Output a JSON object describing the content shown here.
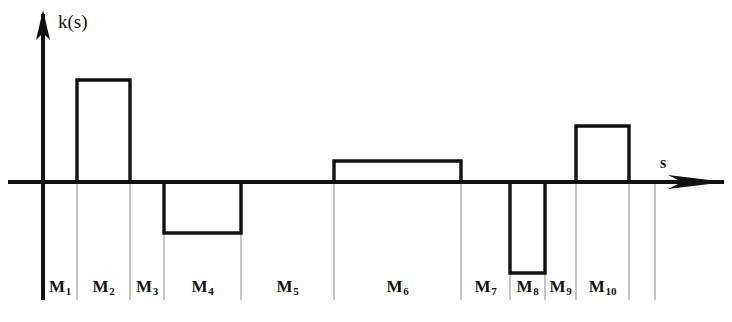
{
  "figure": {
    "kind": "piecewise-constant-curvature-plot",
    "background_color": "#ffffff",
    "stroke_color": "#111111",
    "divider_color": "#8a8a8a",
    "width": 732,
    "height": 322
  },
  "axes": {
    "y_axis_label": "k(s)",
    "x_axis_label": "s",
    "y_axis_x": 43,
    "baseline_y": 182,
    "y_axis_top": 10,
    "y_axis_bottom": 300,
    "x_axis_start": 8,
    "x_axis_end": 726,
    "y_label_pos": {
      "x": 58,
      "y": 12
    },
    "x_label_pos": {
      "x": 660,
      "y": 155
    }
  },
  "chart_data": {
    "type": "bar",
    "title": "",
    "xlabel": "s",
    "ylabel": "k(s)",
    "grid": false,
    "legend": null,
    "baseline": 0,
    "categories": [
      "M1",
      "M2",
      "M3",
      "M4",
      "M5",
      "M6",
      "M7",
      "M8",
      "M9",
      "M10"
    ],
    "tick_labels": [
      "M₁",
      "M₂",
      "M₃",
      "M₄",
      "M₅",
      "M₆",
      "M₇",
      "M₈",
      "M₉",
      "M₁₀"
    ],
    "values": [
      0,
      1.0,
      0,
      -0.5,
      0,
      0.21,
      0,
      -0.89,
      0,
      0.55
    ],
    "value_note": "heights in pixels above/below baseline, scaled by 102 px per 1.0 unit",
    "segments": [
      {
        "label": "M1",
        "sub": "1",
        "x0": 43,
        "x1": 77,
        "height_px": 0,
        "value": 0,
        "sign": "zero"
      },
      {
        "label": "M2",
        "sub": "2",
        "x0": 77,
        "x1": 130,
        "height_px": 102,
        "value": 1.0,
        "sign": "positive"
      },
      {
        "label": "M3",
        "sub": "3",
        "x0": 130,
        "x1": 164,
        "height_px": 0,
        "value": 0,
        "sign": "zero"
      },
      {
        "label": "M4",
        "sub": "4",
        "x0": 164,
        "x1": 241,
        "height_px": 51,
        "value": -0.5,
        "sign": "negative"
      },
      {
        "label": "M5",
        "sub": "5",
        "x0": 241,
        "x1": 334,
        "height_px": 0,
        "value": 0,
        "sign": "zero"
      },
      {
        "label": "M6",
        "sub": "6",
        "x0": 334,
        "x1": 461,
        "height_px": 21,
        "value": 0.21,
        "sign": "positive"
      },
      {
        "label": "M7",
        "sub": "7",
        "x0": 461,
        "x1": 510,
        "height_px": 0,
        "value": 0,
        "sign": "zero"
      },
      {
        "label": "M8",
        "sub": "8",
        "x0": 510,
        "x1": 545,
        "height_px": 91,
        "value": -0.89,
        "sign": "negative"
      },
      {
        "label": "M9",
        "sub": "9",
        "x0": 545,
        "x1": 576,
        "height_px": 0,
        "value": 0,
        "sign": "zero"
      },
      {
        "label": "M10",
        "sub": "10",
        "x0": 576,
        "x1": 629,
        "height_px": 56,
        "value": 0.55,
        "sign": "positive"
      }
    ],
    "divider_positions": [
      77,
      130,
      164,
      241,
      334,
      461,
      510,
      545,
      576,
      629,
      655
    ],
    "label_baseline_y": 295
  }
}
